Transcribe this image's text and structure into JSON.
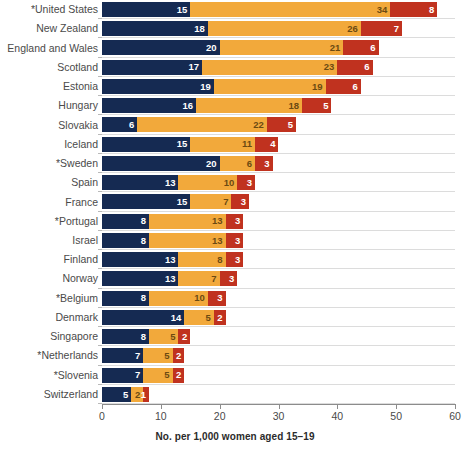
{
  "chart_data": {
    "type": "bar",
    "orientation": "horizontal",
    "stacked": true,
    "title": "",
    "subtitle": "",
    "xlabel": "No. per 1,000 women aged 15–19",
    "ylabel": "",
    "xlim": [
      0,
      60
    ],
    "xticks": [
      0,
      10,
      20,
      30,
      40,
      50,
      60
    ],
    "xtick_labels": [
      "0",
      "10",
      "20",
      "30",
      "40",
      "50",
      "60"
    ],
    "grid": false,
    "legend_position": "none",
    "colors": {
      "series_1": "#152a52",
      "series_2": "#f2a93b",
      "series_3": "#c0321f"
    },
    "categories": [
      "*United States",
      "New Zealand",
      "England and Wales",
      "Scotland",
      "Estonia",
      "Hungary",
      "Slovakia",
      "Iceland",
      "*Sweden",
      "Spain",
      "France",
      "*Portugal",
      "Israel",
      "Finland",
      "Norway",
      "*Belgium",
      "Denmark",
      "Singapore",
      "*Netherlands",
      "*Slovenia",
      "Switzerland"
    ],
    "series": [
      {
        "name": "series_1",
        "color": "#152a52",
        "values": [
          15,
          18,
          20,
          17,
          19,
          16,
          6,
          15,
          20,
          13,
          15,
          8,
          8,
          13,
          13,
          8,
          14,
          8,
          7,
          7,
          5
        ]
      },
      {
        "name": "series_2",
        "color": "#f2a93b",
        "values": [
          34,
          26,
          21,
          23,
          19,
          18,
          22,
          11,
          6,
          10,
          7,
          13,
          13,
          8,
          7,
          10,
          5,
          5,
          5,
          5,
          2
        ]
      },
      {
        "name": "series_3",
        "color": "#c0321f",
        "values": [
          8,
          7,
          6,
          6,
          6,
          5,
          5,
          4,
          3,
          3,
          3,
          3,
          3,
          3,
          3,
          3,
          2,
          2,
          2,
          2,
          1
        ]
      }
    ],
    "totals": [
      57,
      51,
      47,
      46,
      44,
      39,
      33,
      30,
      29,
      26,
      25,
      24,
      24,
      24,
      23,
      21,
      21,
      15,
      14,
      14,
      8
    ]
  }
}
